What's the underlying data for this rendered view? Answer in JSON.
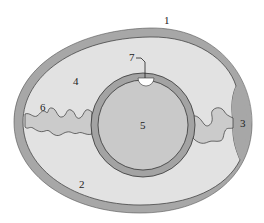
{
  "diagram": {
    "colors": {
      "background": "#ffffff",
      "shell": "#a7a7a7",
      "albumen": "#e2e2e2",
      "yolk_membrane": "#a3a3a3",
      "yolk": "#c9c9c9",
      "air_cell": "#a7a7a7",
      "chalaza": "#cbcbcb",
      "germinal_disc": "#ffffff",
      "outline": "#333333",
      "label_text": "#222222"
    },
    "labels": [
      {
        "id": "1",
        "text": "1",
        "part": "shell"
      },
      {
        "id": "2",
        "text": "2",
        "part": "inner-shell-membrane"
      },
      {
        "id": "3",
        "text": "3",
        "part": "air-cell"
      },
      {
        "id": "4",
        "text": "4",
        "part": "albumen"
      },
      {
        "id": "5",
        "text": "5",
        "part": "yolk"
      },
      {
        "id": "6",
        "text": "6",
        "part": "chalaza"
      },
      {
        "id": "7",
        "text": "7",
        "part": "germinal-disc"
      }
    ]
  }
}
